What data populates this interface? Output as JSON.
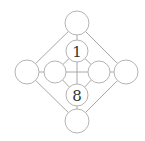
{
  "diagram": {
    "nodes": [
      {
        "id": "top",
        "label": "",
        "cx": 77,
        "cy": 23,
        "r": 12
      },
      {
        "id": "inner-top",
        "label": "1",
        "cx": 77,
        "cy": 51,
        "r": 11
      },
      {
        "id": "outer-left",
        "label": "",
        "cx": 27,
        "cy": 72,
        "r": 12
      },
      {
        "id": "inner-left",
        "label": "",
        "cx": 55,
        "cy": 72,
        "r": 11
      },
      {
        "id": "inner-right",
        "label": "",
        "cx": 99,
        "cy": 72,
        "r": 11
      },
      {
        "id": "outer-right",
        "label": "",
        "cx": 126,
        "cy": 72,
        "r": 12
      },
      {
        "id": "inner-bottom",
        "label": "8",
        "cx": 77,
        "cy": 95,
        "r": 11
      },
      {
        "id": "bottom",
        "label": "",
        "cx": 77,
        "cy": 121,
        "r": 12
      }
    ],
    "labels": {
      "inner_top": "1",
      "inner_bottom": "8"
    }
  }
}
